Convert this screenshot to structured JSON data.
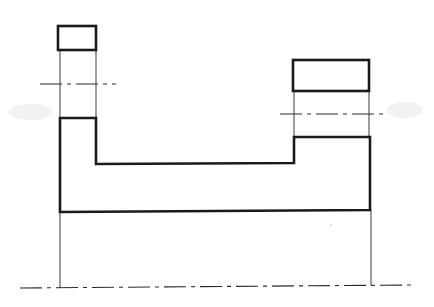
{
  "drawing": {
    "type": "orthographic-projection",
    "description": "Two top-view rectangles projected to a front-view U-shaped profile with center lines",
    "colors": {
      "line": "#1a1a1a",
      "background": "#ffffff"
    },
    "views": {
      "top_left_rect": {
        "x": 58,
        "y": 26,
        "w": 38,
        "h": 24
      },
      "top_right_rect": {
        "x": 293,
        "y": 60,
        "w": 76,
        "h": 31
      },
      "front_profile_points": "60,212 60,118 96,118 96,164 294,163 294,137 370,137 370,210 60,212"
    },
    "center_lines": [
      {
        "name": "left",
        "x1": 40,
        "y1": 84,
        "x2": 116,
        "y2": 84
      },
      {
        "name": "right",
        "x1": 280,
        "y1": 114,
        "x2": 384,
        "y2": 114
      },
      {
        "name": "bottom",
        "x1": 20,
        "y1": 288,
        "x2": 414,
        "y2": 285
      }
    ],
    "projection_lines": [
      {
        "x1": 60,
        "y1": 50,
        "x2": 60,
        "y2": 118
      },
      {
        "x1": 96,
        "y1": 50,
        "x2": 96,
        "y2": 118
      },
      {
        "x1": 294,
        "y1": 91,
        "x2": 294,
        "y2": 137
      },
      {
        "x1": 369,
        "y1": 91,
        "x2": 369,
        "y2": 137
      },
      {
        "x1": 60,
        "y1": 212,
        "x2": 60,
        "y2": 288
      },
      {
        "x1": 371,
        "y1": 210,
        "x2": 371,
        "y2": 285
      }
    ]
  }
}
